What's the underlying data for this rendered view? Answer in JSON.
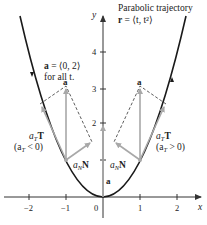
{
  "title": {
    "line1": "Parabolic trajectory",
    "line2_prefix": "r",
    "line2_rest": " = ⟨t, t²⟩"
  },
  "accel_note": {
    "line1_bold": "a",
    "line1_rest": " = ⟨0, 2⟩",
    "line2": "for all t."
  },
  "axes": {
    "x_label": "x",
    "y_label": "y",
    "x_ticks": [
      "−2",
      "−1",
      "0",
      "1",
      "2"
    ],
    "y_ticks": [
      "1",
      "2",
      "3",
      "4"
    ]
  },
  "labels": {
    "a_left": "a",
    "a_right": "a",
    "a_origin": "a",
    "aT_left": "a",
    "aT_left_sub": "T",
    "aT_left_vec": "T",
    "aT_left_cond": "(a",
    "aT_left_cond_sub": "T",
    "aT_left_cond_rest": " < 0)",
    "aT_right": "a",
    "aT_right_sub": "T",
    "aT_right_vec": "T",
    "aT_right_cond": "(a",
    "aT_right_cond_sub": "T",
    "aT_right_cond_rest": " > 0)",
    "aN_left": "a",
    "aN_left_sub": "N",
    "aN_left_vec": "N",
    "aN_right": "a",
    "aN_right_sub": "N",
    "aN_right_vec": "N"
  },
  "colors": {
    "curve": "#1a1a1a",
    "vector": "#a8a8a8",
    "dashed": "#333333",
    "axis": "#333333"
  }
}
